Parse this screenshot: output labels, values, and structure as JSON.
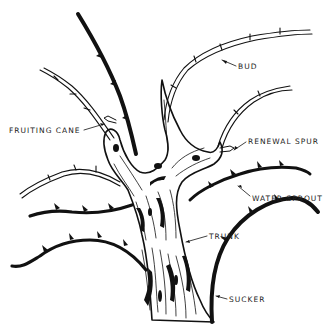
{
  "diagram": {
    "labels": {
      "bud": "BUD",
      "fruiting_cane": "FRUITING CANE",
      "renewal_spur": "RENEWAL SPUR",
      "water_sprout": "WATER SPROUT",
      "trunk": "TRUNK",
      "sucker": "SUCKER"
    },
    "colors": {
      "ink": "#111111",
      "background": "#ffffff"
    }
  }
}
